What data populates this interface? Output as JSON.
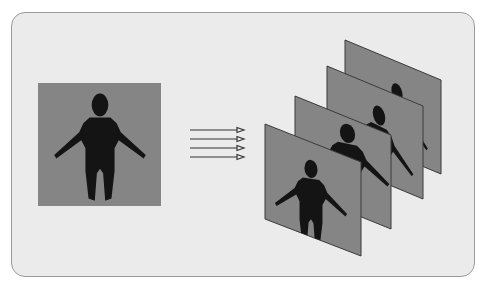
{
  "diagram": {
    "colors": {
      "background": "#ebebeb",
      "card_border": "#9a9a9a",
      "panel_fill": "#858585",
      "panel_edge": "#3a3a3a",
      "silhouette": "#141414",
      "arrow": "#333333"
    },
    "source_image": {
      "label": "",
      "x": 38,
      "y": 83,
      "w": 123,
      "h": 123
    },
    "arrows": {
      "count": 4,
      "x1": 190,
      "x2": 244,
      "ys": [
        130,
        139,
        148,
        157
      ]
    },
    "view_panels": [
      {
        "index": 4,
        "x": 345,
        "y": 40
      },
      {
        "index": 3,
        "x": 327,
        "y": 66
      },
      {
        "index": 2,
        "x": 295,
        "y": 96
      },
      {
        "index": 1,
        "x": 265,
        "y": 124
      }
    ],
    "panel_shape": {
      "width": 96,
      "height": 95,
      "skew": 38
    }
  }
}
